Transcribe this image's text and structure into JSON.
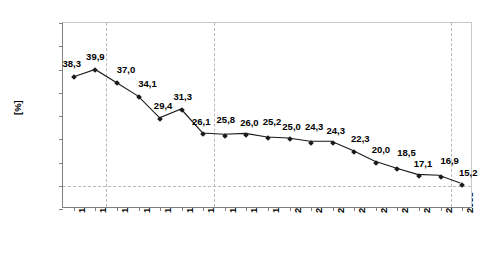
{
  "chart_data": {
    "type": "line",
    "title": "",
    "xlabel": "",
    "ylabel": "[%]",
    "ylim": [
      10.0,
      50.0
    ],
    "ytick_step": 5.0,
    "grid": "dashed vertical gridlines at 1991.5, 1996.5 and 2007.5; dashed horizontal gridline at 15,0",
    "legend": "none",
    "decimal_separator": ",",
    "categories": [
      "1990",
      "1991",
      "1992",
      "1993",
      "1994",
      "1995",
      "1996",
      "1997",
      "1998",
      "1999",
      "2000",
      "2001",
      "2002",
      "2003",
      "2004",
      "2005",
      "2006",
      "2007",
      "2008"
    ],
    "values": [
      38.3,
      39.9,
      37.0,
      34.1,
      29.4,
      31.3,
      26.1,
      25.8,
      26.0,
      25.2,
      25.0,
      24.3,
      24.3,
      22.3,
      20.0,
      18.5,
      17.1,
      16.9,
      15.2
    ],
    "point_labels": [
      "38,3",
      "39,9",
      "37,0",
      "34,1",
      "29,4",
      "31,3",
      "26,1",
      "25,8",
      "26,0",
      "25,2",
      "25,0",
      "24,3",
      "24,3",
      "22,3",
      "20,0",
      "18,5",
      "17,1",
      "16,9",
      "15,2"
    ],
    "ytick_labels": [
      "10,0",
      "15,0",
      "20,0",
      "25,0",
      "30,0",
      "35,0",
      "40,0",
      "45,0",
      "50,0"
    ],
    "ytick_values": [
      10.0,
      15.0,
      20.0,
      25.0,
      30.0,
      35.0,
      40.0,
      45.0,
      50.0
    ],
    "vgrid_positions": [
      1.5,
      6.5,
      17.5
    ],
    "hgrid_values": [
      15.0
    ],
    "series_color": "#1a1a1a",
    "marker_shape": "diamond",
    "marker_color": "#1a1a1a",
    "gridline_color": "#b9b9b9",
    "axis_color": "#808080",
    "background": "#ffffff",
    "label_offsets": [
      {
        "dx": -2,
        "dy": -13
      },
      {
        "dx": 0,
        "dy": -13
      },
      {
        "dx": 9,
        "dy": -13
      },
      {
        "dx": 9,
        "dy": -13
      },
      {
        "dx": 3,
        "dy": -13
      },
      {
        "dx": 1,
        "dy": -13
      },
      {
        "dx": -2,
        "dy": -12
      },
      {
        "dx": 1,
        "dy": -16
      },
      {
        "dx": 3,
        "dy": -12
      },
      {
        "dx": 4,
        "dy": -16
      },
      {
        "dx": 2,
        "dy": -12
      },
      {
        "dx": 3,
        "dy": -16
      },
      {
        "dx": 3,
        "dy": -12
      },
      {
        "dx": 6,
        "dy": -13
      },
      {
        "dx": 5,
        "dy": -13
      },
      {
        "dx": 9,
        "dy": -16
      },
      {
        "dx": 4,
        "dy": -12
      },
      {
        "dx": 9,
        "dy": -16
      },
      {
        "dx": 6,
        "dy": -12
      }
    ]
  }
}
